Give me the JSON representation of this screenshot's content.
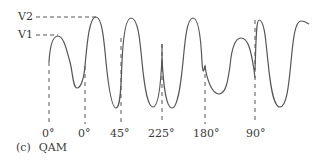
{
  "figure": {
    "type": "waveform-diagram",
    "caption_tag": "(c)",
    "caption_title": "QAM",
    "amplitude_labels": [
      {
        "label": "V2",
        "y": 17
      },
      {
        "label": "V1",
        "y": 35
      }
    ],
    "phase_markers": [
      {
        "label": "0°",
        "x": 49
      },
      {
        "label": "0°",
        "x": 85
      },
      {
        "label": "45°",
        "x": 121
      },
      {
        "label": "225°",
        "x": 162
      },
      {
        "label": "180°",
        "x": 205
      },
      {
        "label": "90°",
        "x": 255
      }
    ],
    "colors": {
      "line": "#555555",
      "text": "#3a3a3a",
      "background": "#ffffff"
    }
  }
}
